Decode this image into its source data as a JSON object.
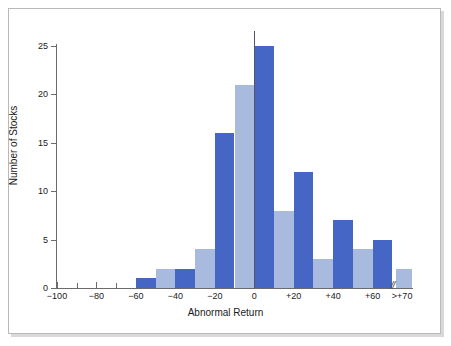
{
  "chart_data": {
    "type": "bar",
    "title": "",
    "xlabel": "Abnormal Return",
    "ylabel": "Number of Stocks",
    "ylim": [
      0,
      26.5
    ],
    "xlim": [
      -100,
      80
    ],
    "yticks": [
      0,
      5,
      10,
      15,
      20,
      25
    ],
    "ytick_labels": [
      "0",
      "5",
      "10",
      "15",
      "20",
      "25"
    ],
    "xtick_labels": [
      "−100",
      "−80",
      "−60",
      "−40",
      "−20",
      "0",
      "+20",
      "+40",
      "+60",
      ">+70"
    ],
    "xtick_values": [
      -100,
      -80,
      -60,
      -40,
      -20,
      0,
      20,
      40,
      60,
      75
    ],
    "minor_xtick_values": [
      -90,
      -70,
      -50,
      -30,
      -10,
      10,
      30,
      50
    ],
    "grid": false,
    "legend": null,
    "bin_width": 10,
    "axis_break_label": "//",
    "zero_reference_line": true,
    "colors": {
      "bar_dark": "#4566c4",
      "bar_light": "#a9badf",
      "axis": "#6b6b6b",
      "text": "#1a1a1a",
      "frame": "#b9b9b9",
      "background": "#ffffff"
    },
    "bars": [
      {
        "bin_start": -60,
        "bin_end": -50,
        "value": 1,
        "color": "bar_dark"
      },
      {
        "bin_start": -50,
        "bin_end": -40,
        "value": 2,
        "color": "bar_light"
      },
      {
        "bin_start": -40,
        "bin_end": -30,
        "value": 2,
        "color": "bar_dark"
      },
      {
        "bin_start": -30,
        "bin_end": -20,
        "value": 4,
        "color": "bar_light"
      },
      {
        "bin_start": -20,
        "bin_end": -10,
        "value": 16,
        "color": "bar_dark"
      },
      {
        "bin_start": -10,
        "bin_end": 0,
        "value": 21,
        "color": "bar_light"
      },
      {
        "bin_start": 0,
        "bin_end": 10,
        "value": 25,
        "color": "bar_dark"
      },
      {
        "bin_start": 10,
        "bin_end": 20,
        "value": 8,
        "color": "bar_light"
      },
      {
        "bin_start": 20,
        "bin_end": 30,
        "value": 12,
        "color": "bar_dark"
      },
      {
        "bin_start": 30,
        "bin_end": 40,
        "value": 3,
        "color": "bar_light"
      },
      {
        "bin_start": 40,
        "bin_end": 50,
        "value": 7,
        "color": "bar_dark"
      },
      {
        "bin_start": 50,
        "bin_end": 60,
        "value": 4,
        "color": "bar_light"
      },
      {
        "bin_start": 60,
        "bin_end": 70,
        "value": 5,
        "color": "bar_dark"
      },
      {
        "bin_start": 72,
        "bin_end": 80,
        "value": 2,
        "color": "bar_light"
      }
    ]
  }
}
